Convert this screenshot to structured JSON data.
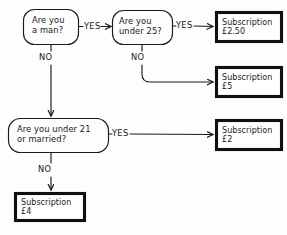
{
  "diagram": {
    "background_color": "#fdfdfd",
    "ink_color": "#1a1a1a",
    "nodes": [
      {
        "id": "q-man",
        "type": "decision",
        "text": "Are you\na man?",
        "x": 23,
        "y": 9,
        "w": 56,
        "h": 36
      },
      {
        "id": "q-under-25",
        "type": "decision",
        "text": "Are you\nunder 25?",
        "x": 112,
        "y": 10,
        "w": 61,
        "h": 35
      },
      {
        "id": "q-under-21",
        "type": "decision",
        "text": "Are you under 21\nor married?",
        "x": 8,
        "y": 118,
        "w": 101,
        "h": 35
      },
      {
        "id": "sub-250",
        "type": "terminal",
        "text": "Subscription\n£2.50",
        "x": 215,
        "y": 11,
        "w": 68,
        "h": 32
      },
      {
        "id": "sub-5",
        "type": "terminal",
        "text": "Subscription\n£5",
        "x": 215,
        "y": 66,
        "w": 68,
        "h": 32
      },
      {
        "id": "sub-2",
        "type": "terminal",
        "text": "Subscription\n£2",
        "x": 215,
        "y": 119,
        "w": 68,
        "h": 32
      },
      {
        "id": "sub-4",
        "type": "terminal",
        "text": "Subscription\n£4",
        "x": 14,
        "y": 192,
        "w": 72,
        "h": 30
      }
    ],
    "edges": [
      {
        "id": "e-man-yes",
        "from": "q-man",
        "to": "q-under-25",
        "label": "YES",
        "label_x": 84,
        "label_y": 22
      },
      {
        "id": "e-man-no",
        "from": "q-man",
        "to": "q-under-21",
        "label": "NO",
        "label_x": 39,
        "label_y": 55
      },
      {
        "id": "e-u25-yes",
        "from": "q-under-25",
        "to": "sub-250",
        "label": "YES",
        "label_x": 177,
        "label_y": 21
      },
      {
        "id": "e-u25-no",
        "from": "q-under-25",
        "to": "sub-5",
        "label": "NO",
        "label_x": 133,
        "label_y": 55
      },
      {
        "id": "e-u21-yes",
        "from": "q-under-21",
        "to": "sub-2",
        "label": "YES",
        "label_x": 115,
        "label_y": 128
      },
      {
        "id": "e-u21-no",
        "from": "q-under-21",
        "to": "sub-4",
        "label": "NO",
        "label_x": 38,
        "label_y": 168
      }
    ]
  }
}
